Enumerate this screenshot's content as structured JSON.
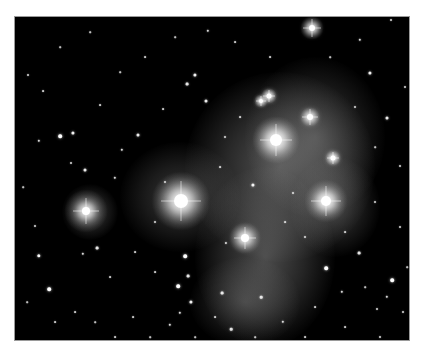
{
  "image": {
    "subject": "Pleiades star cluster with reflection nebula",
    "background": "#000000",
    "border": "#9a9a9a",
    "nebula_color": "#bdbdbd"
  },
  "nebula": [
    {
      "x": 265,
      "y": 150,
      "rx": 95,
      "ry": 95,
      "a": 0.42
    },
    {
      "x": 300,
      "y": 120,
      "rx": 70,
      "ry": 80,
      "a": 0.3
    },
    {
      "x": 250,
      "y": 240,
      "rx": 70,
      "ry": 90,
      "a": 0.38
    },
    {
      "x": 230,
      "y": 285,
      "rx": 55,
      "ry": 45,
      "a": 0.25
    },
    {
      "x": 165,
      "y": 180,
      "rx": 60,
      "ry": 55,
      "a": 0.28
    },
    {
      "x": 75,
      "y": 195,
      "rx": 28,
      "ry": 28,
      "a": 0.3
    },
    {
      "x": 320,
      "y": 190,
      "rx": 45,
      "ry": 50,
      "a": 0.28
    }
  ],
  "bright_stars": [
    {
      "x": 166,
      "y": 184,
      "r": 7,
      "halo": 30,
      "spike": 40
    },
    {
      "x": 261,
      "y": 123,
      "r": 6,
      "halo": 24,
      "spike": 32
    },
    {
      "x": 311,
      "y": 184,
      "r": 5,
      "halo": 22,
      "spike": 30
    },
    {
      "x": 71,
      "y": 194,
      "r": 4,
      "halo": 22,
      "spike": 26
    },
    {
      "x": 230,
      "y": 221,
      "r": 4,
      "halo": 16,
      "spike": 22
    },
    {
      "x": 297,
      "y": 11,
      "r": 3,
      "halo": 12,
      "spike": 18
    },
    {
      "x": 295,
      "y": 100,
      "r": 3,
      "halo": 10,
      "spike": 16
    },
    {
      "x": 254,
      "y": 79,
      "r": 2.5,
      "halo": 8,
      "spike": 12
    },
    {
      "x": 246,
      "y": 84,
      "r": 2,
      "halo": 7,
      "spike": 10
    },
    {
      "x": 318,
      "y": 141,
      "r": 2.5,
      "halo": 8,
      "spike": 12
    }
  ],
  "stars": [
    {
      "x": 45,
      "y": 119,
      "r": 1.8
    },
    {
      "x": 58,
      "y": 116,
      "r": 1.6
    },
    {
      "x": 24,
      "y": 124,
      "r": 1.2
    },
    {
      "x": 13,
      "y": 58,
      "r": 1.0
    },
    {
      "x": 70,
      "y": 153,
      "r": 1.5
    },
    {
      "x": 100,
      "y": 161,
      "r": 1.2
    },
    {
      "x": 56,
      "y": 146,
      "r": 1.0
    },
    {
      "x": 20,
      "y": 209,
      "r": 1.0
    },
    {
      "x": 34,
      "y": 272,
      "r": 1.8
    },
    {
      "x": 24,
      "y": 239,
      "r": 1.7
    },
    {
      "x": 82,
      "y": 231,
      "r": 1.4
    },
    {
      "x": 68,
      "y": 237,
      "r": 1.2
    },
    {
      "x": 170,
      "y": 239,
      "r": 1.8
    },
    {
      "x": 173,
      "y": 259,
      "r": 1.4
    },
    {
      "x": 163,
      "y": 269,
      "r": 1.8
    },
    {
      "x": 176,
      "y": 285,
      "r": 1.6
    },
    {
      "x": 165,
      "y": 296,
      "r": 1.2
    },
    {
      "x": 155,
      "y": 308,
      "r": 1.2
    },
    {
      "x": 180,
      "y": 58,
      "r": 1.6
    },
    {
      "x": 172,
      "y": 67,
      "r": 1.4
    },
    {
      "x": 191,
      "y": 84,
      "r": 1.5
    },
    {
      "x": 193,
      "y": 14,
      "r": 1.2
    },
    {
      "x": 376,
      "y": 3,
      "r": 1.0
    },
    {
      "x": 345,
      "y": 23,
      "r": 1.2
    },
    {
      "x": 355,
      "y": 56,
      "r": 1.6
    },
    {
      "x": 372,
      "y": 101,
      "r": 1.5
    },
    {
      "x": 390,
      "y": 70,
      "r": 1.0
    },
    {
      "x": 385,
      "y": 149,
      "r": 1.0
    },
    {
      "x": 377,
      "y": 263,
      "r": 1.8
    },
    {
      "x": 372,
      "y": 280,
      "r": 1.2
    },
    {
      "x": 362,
      "y": 292,
      "r": 1.0
    },
    {
      "x": 344,
      "y": 236,
      "r": 1.4
    },
    {
      "x": 311,
      "y": 251,
      "r": 1.8
    },
    {
      "x": 268,
      "y": 305,
      "r": 1.2
    },
    {
      "x": 216,
      "y": 312,
      "r": 1.3
    },
    {
      "x": 207,
      "y": 276,
      "r": 1.4
    },
    {
      "x": 327,
      "y": 275,
      "r": 1.2
    },
    {
      "x": 238,
      "y": 168,
      "r": 1.6
    },
    {
      "x": 278,
      "y": 176,
      "r": 1.0
    },
    {
      "x": 246,
      "y": 280,
      "r": 1.3
    },
    {
      "x": 211,
      "y": 226,
      "r": 1.1
    },
    {
      "x": 107,
      "y": 133,
      "r": 1.2
    },
    {
      "x": 123,
      "y": 118,
      "r": 1.5
    },
    {
      "x": 28,
      "y": 74,
      "r": 0.9
    },
    {
      "x": 85,
      "y": 88,
      "r": 0.9
    },
    {
      "x": 130,
      "y": 40,
      "r": 0.9
    },
    {
      "x": 148,
      "y": 92,
      "r": 0.9
    },
    {
      "x": 118,
      "y": 300,
      "r": 0.9
    },
    {
      "x": 60,
      "y": 295,
      "r": 0.9
    },
    {
      "x": 40,
      "y": 305,
      "r": 0.9
    },
    {
      "x": 100,
      "y": 320,
      "r": 0.9
    },
    {
      "x": 385,
      "y": 210,
      "r": 1.0
    },
    {
      "x": 360,
      "y": 185,
      "r": 1.0
    },
    {
      "x": 340,
      "y": 90,
      "r": 1.0
    },
    {
      "x": 255,
      "y": 40,
      "r": 0.9
    },
    {
      "x": 220,
      "y": 25,
      "r": 0.9
    },
    {
      "x": 150,
      "y": 165,
      "r": 1.0
    },
    {
      "x": 140,
      "y": 205,
      "r": 1.0
    },
    {
      "x": 120,
      "y": 235,
      "r": 0.9
    },
    {
      "x": 95,
      "y": 260,
      "r": 0.9
    },
    {
      "x": 140,
      "y": 255,
      "r": 0.9
    },
    {
      "x": 200,
      "y": 300,
      "r": 0.9
    },
    {
      "x": 290,
      "y": 320,
      "r": 0.9
    },
    {
      "x": 330,
      "y": 310,
      "r": 0.9
    },
    {
      "x": 300,
      "y": 290,
      "r": 0.9
    },
    {
      "x": 365,
      "y": 320,
      "r": 1.0
    },
    {
      "x": 388,
      "y": 295,
      "r": 1.0
    },
    {
      "x": 210,
      "y": 120,
      "r": 1.0
    },
    {
      "x": 225,
      "y": 100,
      "r": 0.9
    },
    {
      "x": 205,
      "y": 150,
      "r": 0.9
    },
    {
      "x": 290,
      "y": 220,
      "r": 1.0
    },
    {
      "x": 270,
      "y": 205,
      "r": 0.9
    },
    {
      "x": 330,
      "y": 215,
      "r": 0.9
    },
    {
      "x": 45,
      "y": 30,
      "r": 0.8
    },
    {
      "x": 75,
      "y": 15,
      "r": 0.8
    },
    {
      "x": 105,
      "y": 55,
      "r": 0.8
    },
    {
      "x": 160,
      "y": 20,
      "r": 0.8
    },
    {
      "x": 8,
      "y": 170,
      "r": 0.8
    },
    {
      "x": 12,
      "y": 285,
      "r": 0.8
    },
    {
      "x": 80,
      "y": 305,
      "r": 0.8
    },
    {
      "x": 135,
      "y": 320,
      "r": 0.8
    },
    {
      "x": 315,
      "y": 40,
      "r": 0.8
    },
    {
      "x": 360,
      "y": 130,
      "r": 0.8
    },
    {
      "x": 392,
      "y": 250,
      "r": 0.8
    },
    {
      "x": 350,
      "y": 270,
      "r": 0.8
    },
    {
      "x": 240,
      "y": 320,
      "r": 0.8
    },
    {
      "x": 180,
      "y": 320,
      "r": 0.8
    }
  ]
}
